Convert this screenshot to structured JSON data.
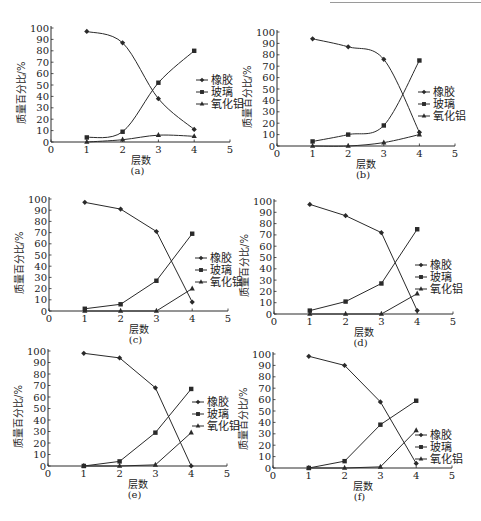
{
  "chart_data": [
    {
      "id": "a",
      "type": "line",
      "caption": "(a)",
      "xlabel": "层数",
      "ylabel": "质量百分比/%",
      "x": [
        1,
        2,
        3,
        4
      ],
      "xlim": [
        0,
        5
      ],
      "ylim": [
        0,
        100
      ],
      "xticks": [
        0,
        1,
        2,
        3,
        4,
        5
      ],
      "yticks": [
        0,
        10,
        20,
        30,
        40,
        50,
        60,
        70,
        80,
        90,
        100
      ],
      "smooth": true,
      "series": [
        {
          "name": "橡胶",
          "marker": "diamond",
          "values": [
            97,
            87,
            38,
            11
          ]
        },
        {
          "name": "玻璃",
          "marker": "square",
          "values": [
            4,
            9,
            52,
            80
          ]
        },
        {
          "name": "氧化铝",
          "marker": "triangle",
          "values": [
            0,
            2,
            6,
            5
          ]
        }
      ],
      "legend_position": "right-middle",
      "grid": false
    },
    {
      "id": "b",
      "type": "line",
      "caption": "(b)",
      "xlabel": "层数",
      "ylabel": "质量百分比/%",
      "x": [
        1,
        2,
        3,
        4
      ],
      "xlim": [
        0,
        5
      ],
      "ylim": [
        0,
        100
      ],
      "xticks": [
        0,
        1,
        2,
        3,
        4,
        5
      ],
      "yticks": [
        0,
        10,
        20,
        30,
        40,
        50,
        60,
        70,
        80,
        90,
        100
      ],
      "smooth": true,
      "series": [
        {
          "name": "橡胶",
          "marker": "diamond",
          "values": [
            94,
            87,
            76,
            12
          ]
        },
        {
          "name": "玻璃",
          "marker": "square",
          "values": [
            4,
            10,
            18,
            75
          ]
        },
        {
          "name": "氧化铝",
          "marker": "triangle",
          "values": [
            0,
            0,
            3,
            10
          ]
        }
      ],
      "legend_position": "right-middle",
      "grid": false
    },
    {
      "id": "c",
      "type": "line",
      "caption": "(c)",
      "xlabel": "层数",
      "ylabel": "质量百分比/%",
      "x": [
        1,
        2,
        3,
        4
      ],
      "xlim": [
        0,
        5
      ],
      "ylim": [
        0,
        100
      ],
      "xticks": [
        0,
        1,
        2,
        3,
        4,
        5
      ],
      "yticks": [
        0,
        10,
        20,
        30,
        40,
        50,
        60,
        70,
        80,
        90,
        100
      ],
      "smooth": false,
      "series": [
        {
          "name": "橡胶",
          "marker": "diamond",
          "values": [
            97,
            91,
            71,
            8
          ]
        },
        {
          "name": "玻璃",
          "marker": "square",
          "values": [
            2,
            6,
            27,
            69
          ]
        },
        {
          "name": "氧化铝",
          "marker": "triangle",
          "values": [
            0,
            0,
            0,
            20
          ]
        }
      ],
      "legend_position": "right-middle",
      "grid": false
    },
    {
      "id": "d",
      "type": "line",
      "caption": "(d)",
      "xlabel": "层数",
      "ylabel": "质量百分比/%",
      "x": [
        1,
        2,
        3,
        4
      ],
      "xlim": [
        0,
        5
      ],
      "ylim": [
        0,
        100
      ],
      "xticks": [
        0,
        1,
        2,
        3,
        4,
        5
      ],
      "yticks": [
        0,
        10,
        20,
        30,
        40,
        50,
        60,
        70,
        80,
        90,
        100
      ],
      "smooth": false,
      "series": [
        {
          "name": "橡胶",
          "marker": "diamond",
          "values": [
            97,
            87,
            72,
            3
          ]
        },
        {
          "name": "玻璃",
          "marker": "square",
          "values": [
            3,
            11,
            27,
            75
          ]
        },
        {
          "name": "氧化铝",
          "marker": "triangle",
          "values": [
            0,
            0,
            0,
            18
          ]
        }
      ],
      "legend_position": "right-middle",
      "grid": false
    },
    {
      "id": "e",
      "type": "line",
      "caption": "(e)",
      "xlabel": "层数",
      "ylabel": "质量百分比/%",
      "x": [
        1,
        2,
        3,
        4
      ],
      "xlim": [
        0,
        5
      ],
      "ylim": [
        0,
        100
      ],
      "xticks": [
        0,
        1,
        2,
        3,
        4,
        5
      ],
      "yticks": [
        0,
        10,
        20,
        30,
        40,
        50,
        60,
        70,
        80,
        90,
        100
      ],
      "smooth": false,
      "series": [
        {
          "name": "橡胶",
          "marker": "diamond",
          "values": [
            98,
            94,
            68,
            0
          ]
        },
        {
          "name": "玻璃",
          "marker": "square",
          "values": [
            0,
            4,
            29,
            67
          ]
        },
        {
          "name": "氧化铝",
          "marker": "triangle",
          "values": [
            0,
            0,
            1,
            29
          ]
        }
      ],
      "legend_position": "right-upper",
      "grid": false
    },
    {
      "id": "f",
      "type": "line",
      "caption": "(f)",
      "xlabel": "层数",
      "ylabel": "质量百分比/%",
      "x": [
        1,
        2,
        3,
        4
      ],
      "xlim": [
        0,
        5
      ],
      "ylim": [
        0,
        100
      ],
      "xticks": [
        0,
        1,
        2,
        3,
        4,
        5
      ],
      "yticks": [
        0,
        10,
        20,
        30,
        40,
        50,
        60,
        70,
        80,
        90,
        100
      ],
      "smooth": false,
      "series": [
        {
          "name": "橡胶",
          "marker": "diamond",
          "values": [
            98,
            90,
            58,
            4
          ]
        },
        {
          "name": "玻璃",
          "marker": "square",
          "values": [
            0,
            6,
            38,
            59
          ]
        },
        {
          "name": "氧化铝",
          "marker": "triangle",
          "values": [
            0,
            0,
            1,
            33
          ]
        }
      ],
      "legend_position": "right-lower",
      "grid": false
    }
  ],
  "style": {
    "line_color": "#2a2a2a",
    "background": "#ffffff"
  }
}
